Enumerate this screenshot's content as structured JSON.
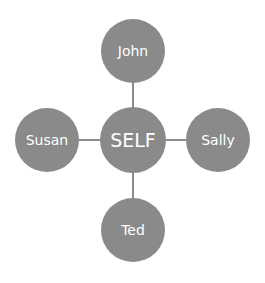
{
  "diagram": {
    "center": {
      "label": "SELF"
    },
    "top": {
      "label": "John"
    },
    "right": {
      "label": "Sally"
    },
    "left": {
      "label": "Susan"
    },
    "bottom": {
      "label": "Ted"
    },
    "colors": {
      "node_fill": "#8a8a8a",
      "connector": "#8c8c8c",
      "text": "#ffffff",
      "background": "#ffffff"
    }
  }
}
